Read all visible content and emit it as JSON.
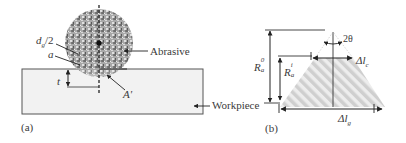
{
  "panel_a": {
    "caption": "(a)",
    "labels": {
      "grain_radius": "d",
      "grain_radius_sub": "g",
      "grain_radius_suffix": "/2",
      "a": "a",
      "t": "t",
      "area": "A'",
      "abrasive": "Abrasive",
      "workpiece": "Workpiece"
    }
  },
  "panel_b": {
    "caption": "(b)",
    "labels": {
      "angle": "2θ",
      "ra0_base": "R",
      "ra0_sub": "a",
      "ra0_sup": "0",
      "rai_base": "R",
      "rai_sub": "a",
      "rai_sup": "i",
      "dlc_base": "Δl",
      "dlc_sub": "c",
      "dlg_base": "Δl",
      "dlg_sub": "g"
    }
  },
  "colors": {
    "line": "#333333",
    "workpiece_fill": "#f2f2f2",
    "abrasive_fill": "#9a9a9a",
    "hatch": "#d0d0d0"
  }
}
